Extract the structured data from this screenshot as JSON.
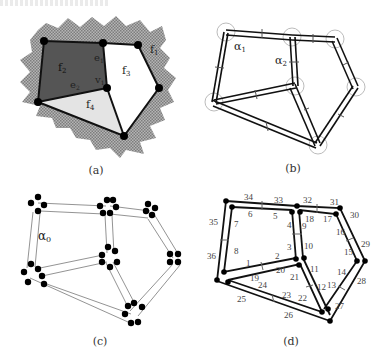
{
  "header": {
    "cropped_text": ""
  },
  "colors": {
    "background": "#ffffff",
    "hatch_outer": "#9a9a9a",
    "face_dark": "#555555",
    "face_light": "#e4e4e4",
    "face_white": "#ffffff",
    "edge": "#111111",
    "vertex": "#000000",
    "arc": "#999999",
    "label": "#222222"
  },
  "panels": [
    {
      "id": "a",
      "caption": "(a)",
      "vertices": {
        "tl": [
          44,
          41
        ],
        "tm": [
          103,
          43
        ],
        "tr": [
          138,
          45
        ],
        "r": [
          159,
          88
        ],
        "v1": [
          107,
          88
        ],
        "l": [
          38,
          102
        ],
        "b": [
          124,
          136
        ]
      },
      "labels": {
        "f1": "f",
        "f1_sub": "1",
        "f2": "f",
        "f2_sub": "2",
        "f3": "f",
        "f3_sub": "3",
        "f4": "f",
        "f4_sub": "4",
        "e1": "e",
        "e1_sub": "1",
        "e2": "e",
        "e2_sub": "2",
        "v1": "v",
        "v1_sub": "1"
      }
    },
    {
      "id": "b",
      "caption": "(b)",
      "labels": {
        "alpha1": "α",
        "alpha1_sub": "1",
        "alpha2": "α",
        "alpha2_sub": "2"
      }
    },
    {
      "id": "c",
      "caption": "(c)",
      "labels": {
        "alpha0": "α",
        "alpha0_sub": "0"
      }
    },
    {
      "id": "d",
      "caption": "(d)",
      "dart_numbers": [
        "1",
        "2",
        "3",
        "4",
        "5",
        "6",
        "7",
        "8",
        "9",
        "10",
        "11",
        "12",
        "13",
        "14",
        "15",
        "16",
        "17",
        "18",
        "19",
        "20",
        "21",
        "22",
        "23",
        "24",
        "25",
        "26",
        "27",
        "28",
        "29",
        "30",
        "31",
        "32",
        "33",
        "34",
        "35",
        "36"
      ]
    }
  ]
}
